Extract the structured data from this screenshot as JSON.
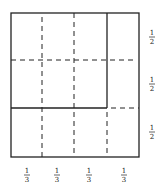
{
  "diagram": {
    "right_labels": [
      {
        "num": "1",
        "den": "2"
      },
      {
        "num": "1",
        "den": "2"
      },
      {
        "num": "1",
        "den": "2"
      }
    ],
    "bottom_labels": [
      {
        "num": "1",
        "den": "3"
      },
      {
        "num": "1",
        "den": "3"
      },
      {
        "num": "1",
        "den": "3"
      },
      {
        "num": "1",
        "den": "3"
      }
    ],
    "colors": {
      "stroke": "#222222",
      "background": "#ffffff"
    }
  }
}
